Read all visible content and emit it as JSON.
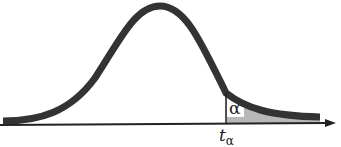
{
  "diagram": {
    "title": "",
    "type": "distribution-upper-tail",
    "curve": "bell-shaped density (t / normal)",
    "shaded_region": "upper tail to the right of critical value",
    "labels": {
      "tail_area": "α",
      "critical_value_base": "t",
      "critical_value_sub": "α"
    },
    "colors": {
      "curve": "#333333",
      "axis": "#222222",
      "shade": "#b8b8b8",
      "background": "#ffffff"
    }
  }
}
